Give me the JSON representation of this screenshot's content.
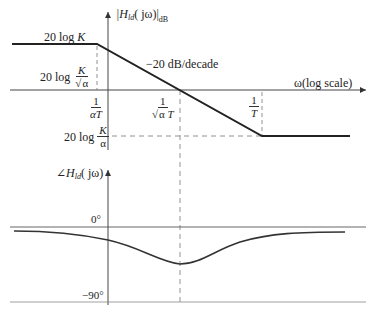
{
  "magnitude_plot": {
    "y_axis_label": {
      "prefix": "|H",
      "subscript": "ld",
      "argument": "( jω)",
      "suffix": "|",
      "unit": "dB"
    },
    "x_axis_label": "ω(log scale)",
    "slope_label": "−20 dB/decade",
    "levels": {
      "high": {
        "text": "20 log ",
        "var": "K"
      },
      "mid": {
        "text": "20 log ",
        "num": "K",
        "den_sqrt": "α"
      },
      "low": {
        "text": "20 log ",
        "num": "K",
        "den": "α"
      }
    },
    "frequency_marks": {
      "f1": {
        "num": "1",
        "den": "αT"
      },
      "f2": {
        "num": "1",
        "den_sqrt": "α",
        "den_rest": " T"
      },
      "f3": {
        "num": "1",
        "den": "T"
      }
    }
  },
  "phase_plot": {
    "y_axis_label": {
      "prefix": "∠H",
      "subscript": "ld",
      "argument": "( jω)"
    },
    "tick_zero": "0°",
    "tick_neg90": "−90°"
  },
  "colors": {
    "line": "#222222",
    "axis": "#555555",
    "dash": "#777777"
  }
}
